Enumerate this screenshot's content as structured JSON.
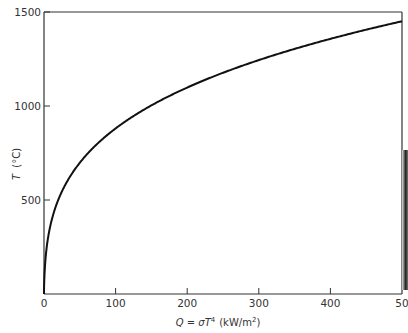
{
  "chart_data": {
    "type": "line",
    "title": "",
    "xlabel": "Q = σT⁴ (kW/m²)",
    "ylabel": "T (°C)",
    "xlim": [
      0,
      500
    ],
    "ylim": [
      0,
      1500
    ],
    "grid": false,
    "legend": null,
    "x_ticks": [
      0,
      100,
      200,
      300,
      400,
      500
    ],
    "x_tick_labels": [
      "0",
      "100",
      "200",
      "300",
      "400",
      "50"
    ],
    "y_ticks": [
      500,
      1000,
      1500
    ],
    "y_tick_labels": [
      "500",
      "1000",
      "1500"
    ],
    "series": [
      {
        "name": "T vs Q",
        "x": [
          0,
          1,
          5,
          10,
          20,
          40,
          60,
          80,
          100,
          150,
          200,
          250,
          300,
          350,
          400,
          450,
          500
        ],
        "y": [
          0,
          95,
          270,
          380,
          510,
          673,
          777,
          858,
          879,
          1002,
          1098,
          1178,
          1248,
          1311,
          1367,
          1420,
          1450
        ]
      }
    ]
  },
  "labels": {
    "ylabel_T": "T",
    "ylabel_unit": "(°C)",
    "xlabel_lhs": "Q = σT",
    "xlabel_exp": "4",
    "xlabel_unit": "(kW/m",
    "xlabel_unit_exp": "2",
    "xlabel_close": ")"
  }
}
